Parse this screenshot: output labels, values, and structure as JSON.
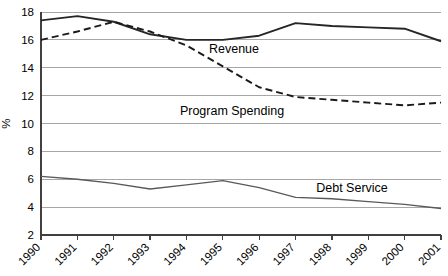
{
  "chart_data": {
    "type": "line",
    "title": "",
    "xlabel": "",
    "ylabel": "%",
    "x": [
      "1990",
      "1991",
      "1992",
      "1993",
      "1994",
      "1995",
      "1996",
      "1997",
      "1998",
      "1999",
      "2000",
      "2001"
    ],
    "categories": [
      "1990",
      "1991",
      "1992",
      "1993",
      "1994",
      "1995",
      "1996",
      "1997",
      "1998",
      "1999",
      "2000",
      "2001"
    ],
    "ylim": [
      2,
      18
    ],
    "yticks": [
      2,
      4,
      6,
      8,
      10,
      12,
      14,
      16,
      18
    ],
    "ytick_labels": [
      "2",
      "4",
      "6",
      "8",
      "10",
      "12",
      "14",
      "16",
      "18"
    ],
    "grid": "horizontal",
    "legend_position": "inline-annotations",
    "series": [
      {
        "name": "Revenue",
        "style": "solid",
        "color": "#262626",
        "width": 1.9,
        "values": [
          17.4,
          17.7,
          17.3,
          16.4,
          16.0,
          16.0,
          16.3,
          17.2,
          17.0,
          16.9,
          16.8,
          15.9
        ],
        "annotation": {
          "label": "Revenue",
          "x_px": 234,
          "y_px": 53
        }
      },
      {
        "name": "Program Spending",
        "style": "dashed",
        "color": "#1a1a1a",
        "width": 1.9,
        "dash": "7,4",
        "values": [
          16.0,
          16.6,
          17.3,
          16.6,
          15.6,
          14.1,
          12.6,
          11.9,
          11.7,
          11.5,
          11.3,
          11.5
        ],
        "annotation": {
          "label": "Program Spending",
          "x_px": 232,
          "y_px": 115
        }
      },
      {
        "name": "Debt Service",
        "style": "solid",
        "color": "#595959",
        "width": 1.3,
        "values": [
          6.2,
          6.0,
          5.7,
          5.3,
          5.6,
          5.9,
          5.4,
          4.7,
          4.6,
          4.4,
          4.2,
          3.9
        ],
        "annotation": {
          "label": "Debt Service",
          "x_px": 352,
          "y_px": 192
        }
      }
    ]
  },
  "plot_geometry": {
    "left_px": 41,
    "right_px": 441,
    "top_px": 12,
    "bottom_px": 235
  }
}
